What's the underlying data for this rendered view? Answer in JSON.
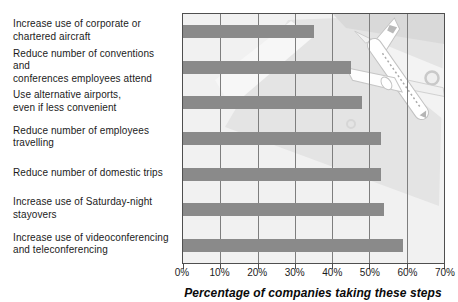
{
  "chart_data": {
    "type": "bar",
    "orientation": "horizontal",
    "title": "",
    "xlabel": "Percentage of companies taking these steps",
    "ylabel": "",
    "xlim": [
      0,
      70
    ],
    "x_tick_labels": [
      "0%",
      "10%",
      "20%",
      "30%",
      "40%",
      "50%",
      "60%",
      "70%"
    ],
    "grid": true,
    "legend": false,
    "categories": [
      [
        "Increase use of corporate or",
        "chartered aircraft"
      ],
      [
        "Reduce number of conventions and",
        "conferences employees attend"
      ],
      [
        "Use alternative airports,",
        "even if less convenient"
      ],
      [
        "Reduce number of employees",
        "travelling"
      ],
      [
        "Reduce number of domestic trips"
      ],
      [
        "Increase use of Saturday-night",
        "stayovers"
      ],
      [
        "Increase use of videoconferencing",
        "and teleconferencing"
      ]
    ],
    "values": [
      35,
      45,
      48,
      53,
      53,
      54,
      59
    ],
    "colors": {
      "bar": "#8a8a8a",
      "plot_background": "#f1f1f1",
      "gridline": "#7e7e7e",
      "border": "#4f4f4f",
      "text": "#1b1b1b"
    },
    "watermark": "airplane-over-envelope"
  }
}
